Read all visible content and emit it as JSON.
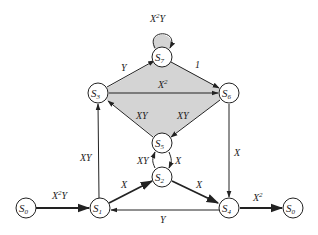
{
  "diagram": {
    "type": "state-transition-diagram",
    "colors": {
      "line": "#222222",
      "shaded_region": "#d4d4d4",
      "node_fill": "#ffffff",
      "background": "#ffffff"
    },
    "nodes": [
      {
        "id": "S0_in",
        "label": "S",
        "sub": "0"
      },
      {
        "id": "S1",
        "label": "S",
        "sub": "1"
      },
      {
        "id": "S2",
        "label": "S",
        "sub": "2"
      },
      {
        "id": "S3",
        "label": "S",
        "sub": "3"
      },
      {
        "id": "S4",
        "label": "S",
        "sub": "4"
      },
      {
        "id": "S5",
        "label": "S",
        "sub": "5"
      },
      {
        "id": "S6",
        "label": "S",
        "sub": "6"
      },
      {
        "id": "S7",
        "label": "S",
        "sub": "7"
      },
      {
        "id": "S0_out",
        "label": "S",
        "sub": "0"
      }
    ],
    "edges": [
      {
        "from": "S0",
        "to": "S1",
        "base": "X",
        "sup": "2",
        "tail": "Y"
      },
      {
        "from": "S1",
        "to": "S3",
        "base": "XY",
        "sup": "",
        "tail": ""
      },
      {
        "from": "S1",
        "to": "S2",
        "base": "X",
        "sup": "",
        "tail": ""
      },
      {
        "from": "S2",
        "to": "S5",
        "base": "XY",
        "sup": "",
        "tail": ""
      },
      {
        "from": "S5",
        "to": "S2",
        "base": "X",
        "sup": "",
        "tail": ""
      },
      {
        "from": "S2",
        "to": "S4",
        "base": "X",
        "sup": "",
        "tail": ""
      },
      {
        "from": "S4",
        "to": "S1",
        "base": "Y",
        "sup": "",
        "tail": ""
      },
      {
        "from": "S4",
        "to": "S0",
        "base": "X",
        "sup": "2",
        "tail": ""
      },
      {
        "from": "S3",
        "to": "S7",
        "base": "Y",
        "sup": "",
        "tail": ""
      },
      {
        "from": "S7",
        "to": "S7",
        "base": "X",
        "sup": "2",
        "tail": "Y"
      },
      {
        "from": "S7",
        "to": "S6",
        "base": "1",
        "sup": "",
        "tail": ""
      },
      {
        "from": "S3",
        "to": "S6",
        "base": "X",
        "sup": "2",
        "tail": ""
      },
      {
        "from": "S5",
        "to": "S3",
        "base": "XY",
        "sup": "",
        "tail": ""
      },
      {
        "from": "S6",
        "to": "S5",
        "base": "XY",
        "sup": "",
        "tail": ""
      },
      {
        "from": "S6",
        "to": "S4",
        "base": "X",
        "sup": "",
        "tail": ""
      }
    ]
  }
}
